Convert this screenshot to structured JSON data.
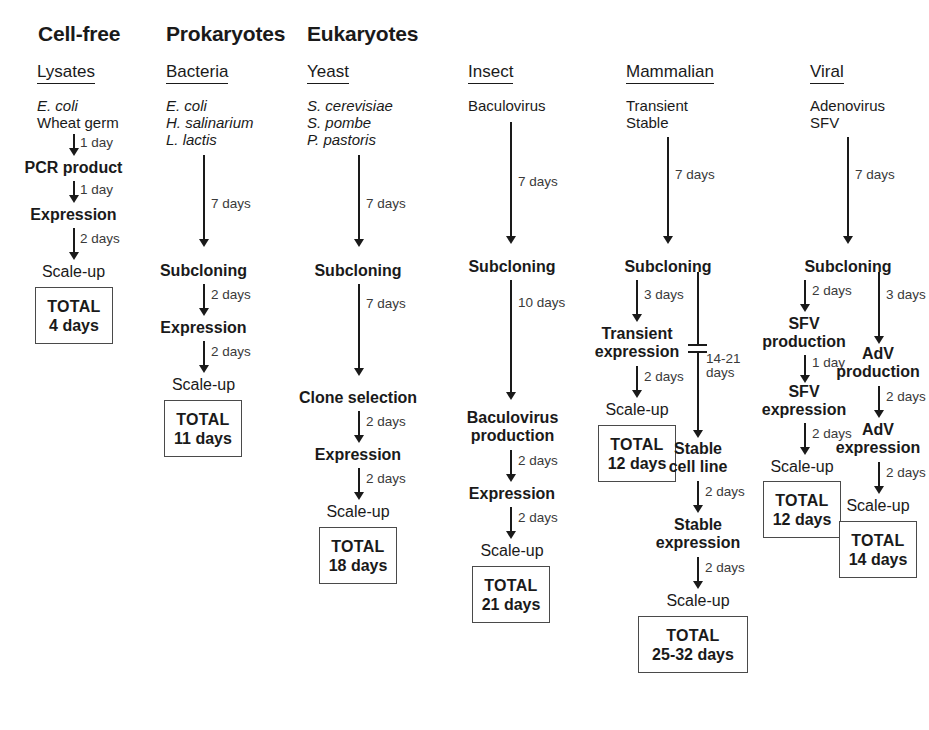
{
  "figure": {
    "type": "flowchart"
  },
  "group_headers": [
    {
      "label": "Cell-free"
    },
    {
      "label": "Prokaryotes"
    },
    {
      "label": "Eukaryotes"
    }
  ],
  "columns": [
    {
      "id": "lysates",
      "header": "Lysates",
      "organisms": [
        "E. coli",
        "Wheat germ"
      ],
      "steps": [
        "PCR product",
        "Expression",
        "Scale-up"
      ],
      "durations": [
        "1 day",
        "1 day",
        "2 days"
      ],
      "total_label": "TOTAL",
      "total_value": "4 days"
    },
    {
      "id": "bacteria",
      "header": "Bacteria",
      "organisms": [
        "E. coli",
        "H. salinarium",
        "L. lactis"
      ],
      "steps": [
        "Subcloning",
        "Expression",
        "Scale-up"
      ],
      "durations": [
        "7 days",
        "2 days",
        "2 days"
      ],
      "total_label": "TOTAL",
      "total_value": "11 days"
    },
    {
      "id": "yeast",
      "header": "Yeast",
      "organisms": [
        "S. cerevisiae",
        "S. pombe",
        "P. pastoris"
      ],
      "steps": [
        "Subcloning",
        "Clone selection",
        "Expression",
        "Scale-up"
      ],
      "durations": [
        "7 days",
        "7 days",
        "2 days",
        "2 days"
      ],
      "total_label": "TOTAL",
      "total_value": "18 days"
    },
    {
      "id": "insect",
      "header": "Insect",
      "organisms": [
        "Baculovirus"
      ],
      "steps": [
        "Subcloning",
        "Baculovirus production",
        "Expression",
        "Scale-up"
      ],
      "durations": [
        "7 days",
        "10 days",
        "2 days",
        "2 days"
      ],
      "total_label": "TOTAL",
      "total_value": "21 days"
    },
    {
      "id": "mammalian",
      "header": "Mammalian",
      "organisms": [
        "Transient",
        "Stable"
      ],
      "shared_step": "Subcloning",
      "shared_duration": "7 days",
      "branches": [
        {
          "id": "transient",
          "steps": [
            "Transient expression",
            "Scale-up"
          ],
          "durations": [
            "3 days",
            "2 days"
          ],
          "total_label": "TOTAL",
          "total_value": "12 days"
        },
        {
          "id": "stable",
          "steps": [
            "Stable cell line",
            "Stable expression",
            "Scale-up"
          ],
          "durations": [
            "14-21 days",
            "2 days",
            "2 days"
          ],
          "total_label": "TOTAL",
          "total_value": "25-32 days"
        }
      ]
    },
    {
      "id": "viral",
      "header": "Viral",
      "organisms": [
        "Adenovirus",
        "SFV"
      ],
      "shared_step": "Subcloning",
      "shared_duration": "7 days",
      "branches": [
        {
          "id": "sfv",
          "steps": [
            "SFV production",
            "SFV expression",
            "Scale-up"
          ],
          "durations": [
            "2 days",
            "1 day",
            "2 days"
          ],
          "total_label": "TOTAL",
          "total_value": "12 days"
        },
        {
          "id": "adv",
          "steps": [
            "AdV production",
            "AdV expression",
            "Scale-up"
          ],
          "durations": [
            "3 days",
            "2 days",
            "2 days"
          ],
          "total_label": "TOTAL",
          "total_value": "14 days"
        }
      ]
    }
  ],
  "labels": {
    "mammalian_transient_expression_line1": "Transient",
    "mammalian_transient_expression_line2": "expression",
    "mammalian_stable_cellline_line1": "Stable",
    "mammalian_stable_cellline_line2": "cell line",
    "mammalian_stable_expression_line1": "Stable",
    "mammalian_stable_expression_line2": "expression",
    "insect_baculovirus_line1": "Baculovirus",
    "insect_baculovirus_line2": "production",
    "viral_sfv_production_line1": "SFV",
    "viral_sfv_production_line2": "production",
    "viral_sfv_expression_line1": "SFV",
    "viral_sfv_expression_line2": "expression",
    "viral_adv_production_line1": "AdV",
    "viral_adv_production_line2": "production",
    "viral_adv_expression_line1": "AdV",
    "viral_adv_expression_line2": "expression",
    "mammalian_14_21_line1": "14-21",
    "mammalian_14_21_line2": "days"
  },
  "colors": {
    "ink": "#1a1a1a",
    "muted": "#3a3a3a",
    "box_border": "#4a4a4a",
    "background": "#ffffff"
  }
}
